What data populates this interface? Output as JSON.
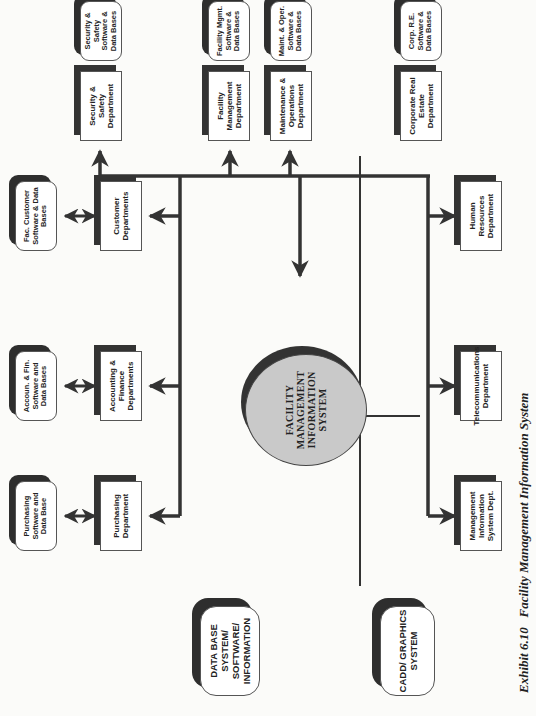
{
  "diagram": {
    "hub": "FACILITY MANAGEMENT INFORMATION SYSTEM",
    "caption": {
      "exhibit": "Exhibit 6.10",
      "title": "Facility Management Information System"
    },
    "departments": [
      {
        "id": "purchasing",
        "label": "Purchasing Department",
        "software": "Purchasing Software and Data Base"
      },
      {
        "id": "accounting",
        "label": "Accounting & Finance Departments",
        "software": "Accoun. & Fin. Software and Data Bases"
      },
      {
        "id": "customer",
        "label": "Customer Departments",
        "software": "Fac. Customer Software & Data Bases"
      },
      {
        "id": "security",
        "label": "Security & Safety Department",
        "software": "Security & Safety Software & Data Bases"
      },
      {
        "id": "facility",
        "label": "Facility Management Department",
        "software": "Facility Mgmt. Software & Data Bases"
      },
      {
        "id": "maintenance",
        "label": "Maintenance & Operations Department",
        "software": "Maint. & Oper. Software & Data Bases"
      },
      {
        "id": "real-estate",
        "label": "Corporate Real Estate Department",
        "software": "Corp. R.E. Software & Data Bases"
      },
      {
        "id": "mis",
        "label": "Management Information System Dept.",
        "software": "M.I.S. Systems Software & Data Base"
      },
      {
        "id": "telecom",
        "label": "Telecommunications Department",
        "software": "Tele. Systems, Software and Data Base"
      },
      {
        "id": "hr",
        "label": "Human Resources Department",
        "software": "H.R. Software and Data Base"
      }
    ],
    "systems": [
      {
        "id": "cadd",
        "label": "CADD/ GRAPHICS SYSTEM",
        "children": [
          "Telecommunications Cable & Port Graphical Info.",
          "Building/Floor/ Department Graphical Information",
          "M.I.S. Major Equipment & Cable Graphical Info.",
          "Engr. & Maint. Fixed Equip. & Building/Site Graphical Info."
        ]
      },
      {
        "id": "database",
        "label": "DATA BASE SYSTEM/ SOFTWARE/ INFORMATION",
        "children": [
          "Real Estate and Building Data Base and Inventory",
          "Equip., Cost & Furnishings Data Base and Inventory",
          "Management Info. System (M.I.S.) Data Base & Inv.",
          "Maint. & Operations Data Base & Bldg./ Equip. Inv."
        ]
      }
    ],
    "colors": {
      "ink": "#333333",
      "hub_fill": "#c9c9c9",
      "paper": "#fbfbf9"
    }
  }
}
